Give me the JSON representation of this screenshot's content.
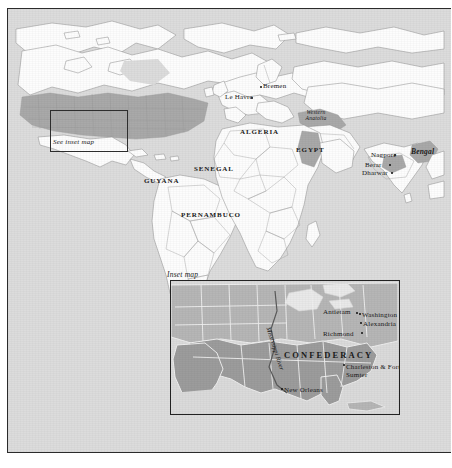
{
  "figure": {
    "type": "historical-thematic-map",
    "title_visible": false,
    "colors": {
      "ocean": "#dcdcdc",
      "land": "#fdfdfd",
      "highlight": "#a9a9a9",
      "inset_land": "#b9b9b9",
      "inset_confederacy": "#9a9a9a",
      "frame": "#2b2b2b",
      "text": "#1a1a1a"
    }
  },
  "world_map": {
    "see_inset_note": "See inset map",
    "labels": [
      {
        "text": "Bremen",
        "style": "city",
        "x": 262,
        "y": 82,
        "dot": true,
        "dot_x": 259,
        "dot_y": 84
      },
      {
        "text": "Le Havre",
        "style": "city",
        "x": 224,
        "y": 95,
        "dot": true,
        "dot_x": 250,
        "dot_y": 95
      },
      {
        "text": "ALGERIA",
        "style": "caps",
        "x": 239,
        "y": 128,
        "dot": false
      },
      {
        "text": "EGYPT",
        "style": "caps",
        "x": 294,
        "y": 146,
        "dot": false
      },
      {
        "text": "Western Anatolia",
        "style": "italic",
        "x": 299,
        "y": 108,
        "dot": false
      },
      {
        "text": "SENEGAL",
        "style": "caps",
        "x": 193,
        "y": 165,
        "dot": false
      },
      {
        "text": "GUYANA",
        "style": "caps",
        "x": 143,
        "y": 177,
        "dot": false
      },
      {
        "text": "PERNAMBUCO",
        "style": "caps",
        "x": 180,
        "y": 211,
        "dot": false
      },
      {
        "text": "Nagpore",
        "style": "city",
        "x": 371,
        "y": 151,
        "dot": true,
        "dot_x": 394,
        "dot_y": 153
      },
      {
        "text": "Berar",
        "style": "city",
        "x": 365,
        "y": 161,
        "dot": true,
        "dot_x": 388,
        "dot_y": 163
      },
      {
        "text": "Dharwar",
        "style": "city",
        "x": 362,
        "y": 170,
        "dot": true,
        "dot_x": 390,
        "dot_y": 170
      },
      {
        "text": "Bengal",
        "style": "italic-bold",
        "x": 410,
        "y": 147,
        "dot": false
      }
    ]
  },
  "inset_map": {
    "title": "Inset map",
    "region_label": "CONFEDERACY",
    "river_label": "Mississippi River",
    "labels": [
      {
        "text": "Antietam",
        "style": "city",
        "x": 318,
        "y": 299,
        "dot": true,
        "dot_x": 351,
        "dot_y": 303
      },
      {
        "text": "Washington",
        "style": "city",
        "x": 355,
        "y": 303,
        "dot": true,
        "dot_x": 352,
        "dot_y": 303
      },
      {
        "text": "Alexandria",
        "style": "city",
        "x": 355,
        "y": 312,
        "dot": true,
        "dot_x": 352,
        "dot_y": 311
      },
      {
        "text": "Richmond",
        "style": "city",
        "x": 316,
        "y": 323,
        "dot": true,
        "dot_x": 354,
        "dot_y": 322
      },
      {
        "text": "Charleston & Fort Sumter",
        "style": "two-line",
        "x": 338,
        "y": 355,
        "dot": true,
        "dot_x": 335,
        "dot_y": 354
      },
      {
        "text": "New Orleans",
        "style": "city",
        "x": 276,
        "y": 378,
        "dot": true,
        "dot_x": 272,
        "dot_y": 377
      }
    ]
  },
  "icons": {
    "inset_indicator": "rectangle-outline-icon"
  }
}
